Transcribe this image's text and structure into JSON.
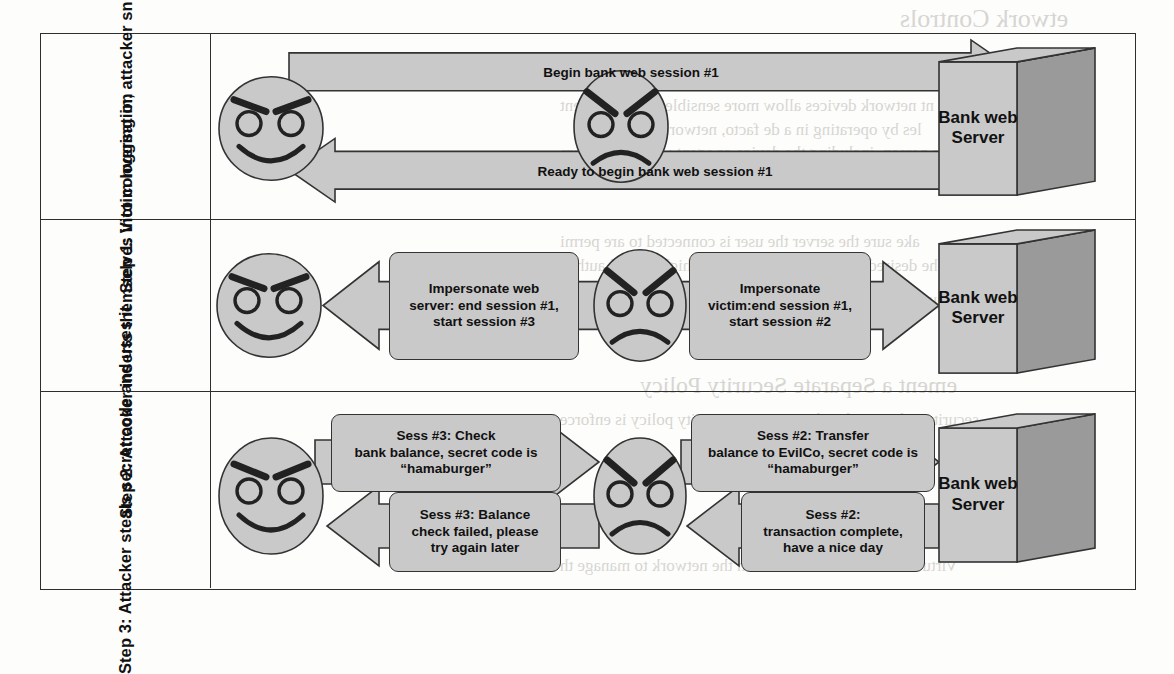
{
  "figure": {
    "frame": {
      "border_color": "#2e2e2e"
    },
    "palette": {
      "shape_fill": "#c9c9c9",
      "shape_shadow": "#9a9a9a",
      "stroke": "#333333",
      "text": "#111111",
      "page_background": "#fdfdfc"
    },
    "server_label": "Bank web\nServer",
    "actors": {
      "victim": "victim-happy-face",
      "attacker": "attacker-angry-face",
      "server": "bank-web-server"
    }
  },
  "steps": [
    {
      "id": "step-1",
      "label": "Step 1:\nVictim logging in,\nattacker sniffing",
      "server": "Bank web\nServer",
      "messages": [
        {
          "id": "s1-m1",
          "text": "Begin bank web session #1",
          "direction": "right",
          "style": "bar"
        },
        {
          "id": "s1-m2",
          "text": "Ready to begin bank web session #1",
          "direction": "left",
          "style": "bar"
        }
      ]
    },
    {
      "id": "step-2",
      "label": "Step 2:\nAttacker inserts\nthemselves into\nconversation",
      "server": "Bank web\nServer",
      "messages": [
        {
          "id": "s2-m1",
          "text": "Impersonate web\nserver: end session #1,\nstart session #3",
          "direction": "left",
          "style": "callout"
        },
        {
          "id": "s2-m2",
          "text": "Impersonate\nvictim:end session #1,\nstart session #2",
          "direction": "right",
          "style": "callout"
        }
      ]
    },
    {
      "id": "step-3",
      "label": "Step 3:\nAttacker steals\nsecret code and\nuses it",
      "server": "Bank web\nServer",
      "messages": [
        {
          "id": "s3-m1",
          "text": "Sess #3: Check\nbank balance, secret code is\n“hamaburger”",
          "direction": "right",
          "style": "callout"
        },
        {
          "id": "s3-m2",
          "text": "Sess #3: Balance\ncheck failed, please\ntry again later",
          "direction": "left",
          "style": "callout"
        },
        {
          "id": "s3-m3",
          "text": "Sess #2: Transfer\nbalance to EvilCo, secret code is\n“hamaburger”",
          "direction": "right",
          "style": "callout"
        },
        {
          "id": "s3-m4",
          "text": "Sess #2:\ntransaction complete,\nhave a nice day",
          "direction": "left",
          "style": "callout"
        }
      ]
    }
  ],
  "bleed_text": [
    {
      "text": "etwork Controls",
      "x": 900,
      "y": 4,
      "size": 26
    },
    {
      "text": "nt network devices allow more sensible work than cent",
      "x": 560,
      "y": 96,
      "size": 17
    },
    {
      "text": "les by operating in a de facto, network access cont",
      "x": 580,
      "y": 120,
      "size": 17
    },
    {
      "text": "of the person, including the device or agent when the transm",
      "x": 560,
      "y": 143,
      "size": 17
    },
    {
      "text": "the use of end-to-end system traffic across the network",
      "x": 580,
      "y": 166,
      "size": 17
    },
    {
      "text": "ake sure the server the user is connected to are permi",
      "x": 560,
      "y": 232,
      "size": 17
    },
    {
      "text": "he desired flow, and if not, does the higher-level authen",
      "x": 560,
      "y": 256,
      "size": 17
    },
    {
      "text": "equests from the outside world must pass through the fir",
      "x": 570,
      "y": 290,
      "size": 17
    },
    {
      "text": "ement a Separate Security Policy",
      "x": 640,
      "y": 372,
      "size": 24
    },
    {
      "text": "security policy so that the corporate security policy is enforce",
      "x": 560,
      "y": 410,
      "size": 17
    },
    {
      "text": "Virtual machines can be used on the network to manage th",
      "x": 560,
      "y": 556,
      "size": 17
    }
  ]
}
